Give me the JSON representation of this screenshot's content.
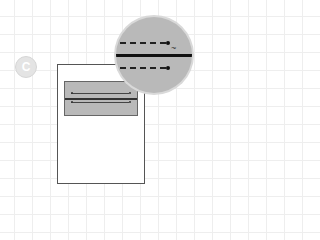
{
  "diagram": {
    "step_badge": {
      "label": "C"
    },
    "magnifier": {
      "description": "zoomed view of field lines",
      "cursor_glyph": "~"
    },
    "page": {
      "field_box": {
        "lines": 2
      }
    },
    "colors": {
      "grid": "#eeeeee",
      "field_fill": "#b9b9b9",
      "line": "#111111",
      "page": "#ffffff"
    }
  }
}
